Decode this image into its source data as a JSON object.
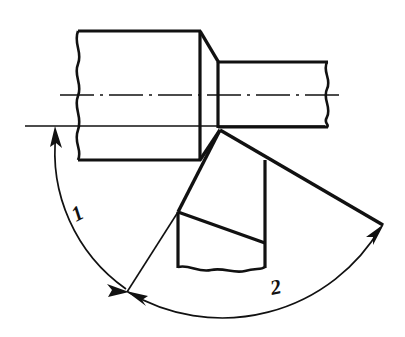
{
  "figure": {
    "type": "engineering-drawing",
    "background_color": "#ffffff",
    "line_color": "#111111",
    "width": 405,
    "height": 337
  },
  "labels": [
    {
      "id": "angle-1",
      "text": "1",
      "x": 76,
      "y": 222,
      "rotation": -28,
      "description": "angular dimension label on left arc"
    },
    {
      "id": "angle-2",
      "text": "2",
      "x": 272,
      "y": 295,
      "rotation": -12,
      "description": "angular dimension label on right arc"
    }
  ],
  "parts": {
    "large_cylinder": {
      "name": "large-shaft-section",
      "left_break_x": 78,
      "top_y": 31,
      "bottom_y": 160,
      "right_x": 200
    },
    "small_cylinder": {
      "name": "small-shaft-section",
      "right_break_x": 327,
      "top_y": 62,
      "bottom_y": 127,
      "left_x": 218
    },
    "chamfer": {
      "name": "chamfer-face",
      "top": [
        200,
        31
      ],
      "bottom": [
        220,
        130
      ]
    },
    "centerline": {
      "name": "axis-centerline",
      "y": 95,
      "x_start": 60,
      "x_end": 345,
      "style": "dash-dot"
    },
    "reference_line": {
      "name": "horizontal-reference-line",
      "y": 126,
      "x_start": 25,
      "x_end": 325
    },
    "cutting_tool": {
      "name": "cutting-tool-body",
      "apex": [
        220,
        130
      ],
      "left_vertex": [
        178,
        212
      ],
      "bottom_left": [
        178,
        267
      ],
      "bottom_right": [
        265,
        267
      ],
      "right_vertex": [
        265,
        160
      ],
      "rake_face_end": [
        383,
        225
      ]
    }
  },
  "dimension_arcs": [
    {
      "id": "arc-1",
      "label": "1",
      "name": "angular-dimension-arc-1",
      "center": [
        220,
        130
      ],
      "radius": 165,
      "start_point": [
        57,
        130
      ],
      "end_point": [
        128,
        290
      ],
      "start_arrow": "up",
      "end_arrow": "down-right"
    },
    {
      "id": "arc-2",
      "label": "2",
      "name": "angular-dimension-arc-2",
      "center": [
        220,
        130
      ],
      "radius": 182,
      "start_point": [
        128,
        290
      ],
      "end_point": [
        383,
        225
      ],
      "start_arrow": "right",
      "end_arrow": "up-right"
    }
  ]
}
